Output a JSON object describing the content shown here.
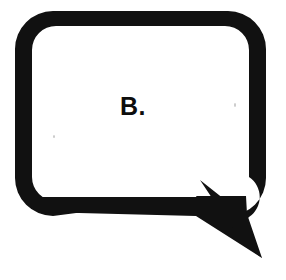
{
  "image": {
    "kind": "speech-bubble-illustration",
    "width": 286,
    "height": 280,
    "background_color": "#ffffff"
  },
  "bubble": {
    "label": "B.",
    "shape": "rounded-rectangle-with-pointed-tail",
    "outline_color": "#111111",
    "fill_color": "#ffffff",
    "stroke_width_px": 15,
    "corner_radius_px": 38,
    "box": {
      "left": 15,
      "top": 11,
      "right": 266,
      "bottom": 216
    },
    "tail": {
      "direction": "down-right",
      "style": "sharp-spike",
      "tip_x": 262,
      "tip_y": 258
    }
  },
  "artifacts": {
    "speck_color": "#c9c9c9",
    "specks": [
      {
        "name": "speck-left",
        "x": 53,
        "y": 135
      },
      {
        "name": "speck-right",
        "x": 234,
        "y": 103
      }
    ]
  }
}
